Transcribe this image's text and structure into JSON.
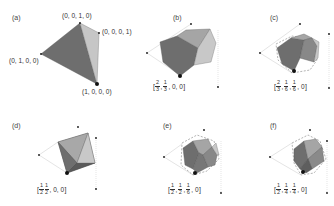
{
  "figure": {
    "colors": {
      "dark_face": "#6e6e6e",
      "mid_face": "#8f8f8f",
      "light_face": "#bdbdbd",
      "lightest_face": "#d6d6d6",
      "vertex_dot": "#111111",
      "guide_line": "#aaaaaa",
      "dashed_edge": "#666666"
    },
    "panels": [
      {
        "id": "a",
        "label": "(a)",
        "vertices": [
          {
            "label": "(0, 0, 1, 0)"
          },
          {
            "label": "(0, 0, 0, 1)"
          },
          {
            "label": "(0, 1, 0, 0)"
          },
          {
            "label": "(1, 0, 0, 0)"
          }
        ]
      },
      {
        "id": "b",
        "label": "(b)",
        "coord": {
          "open": "[",
          "fracs": [
            {
              "num": "2",
              "den": "3"
            },
            {
              "num": "1",
              "den": "3"
            }
          ],
          "rest": ", 0, 0",
          "close": "]"
        }
      },
      {
        "id": "c",
        "label": "(c)",
        "coord": {
          "open": "[",
          "fracs": [
            {
              "num": "2",
              "den": "3"
            },
            {
              "num": "1",
              "den": "6"
            },
            {
              "num": "1",
              "den": "6"
            }
          ],
          "rest": ", 0",
          "close": "]"
        }
      },
      {
        "id": "d",
        "label": "(d)",
        "coord": {
          "open": "[",
          "fracs": [
            {
              "num": "1",
              "den": "2"
            },
            {
              "num": "1",
              "den": "2"
            }
          ],
          "rest": ", 0, 0",
          "close": "]"
        }
      },
      {
        "id": "e",
        "label": "(e)",
        "coord": {
          "open": "[",
          "fracs": [
            {
              "num": "1",
              "den": "2"
            },
            {
              "num": "1",
              "den": "2"
            },
            {
              "num": "1",
              "den": "6"
            }
          ],
          "rest": ", 0",
          "close": "]"
        }
      },
      {
        "id": "f",
        "label": "(f)",
        "coord": {
          "open": "[",
          "fracs": [
            {
              "num": "1",
              "den": "2"
            },
            {
              "num": "1",
              "den": "4"
            },
            {
              "num": "1",
              "den": "4"
            }
          ],
          "rest": ", 0",
          "close": "]"
        }
      }
    ]
  }
}
